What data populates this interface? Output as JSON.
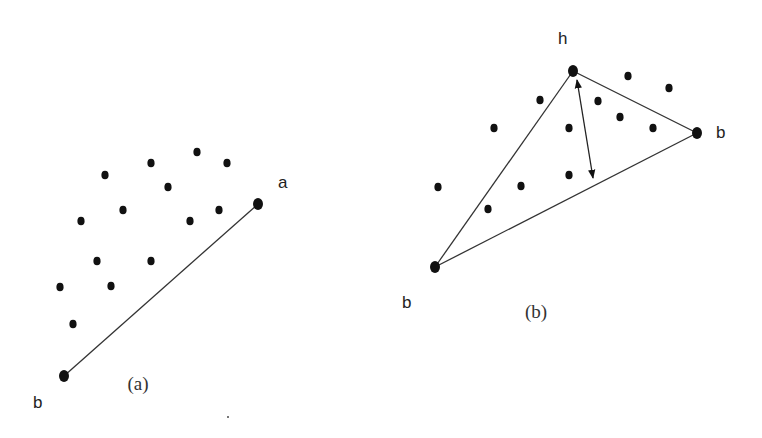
{
  "figure": {
    "panel_a": {
      "caption": "(a)",
      "caption_pos": [
        138,
        390
      ],
      "labels": [
        {
          "text": "a",
          "x": 278,
          "y": 188
        },
        {
          "text": "b",
          "x": 33,
          "y": 408
        }
      ],
      "endpoints": [
        {
          "name": "a",
          "x": 258,
          "y": 204
        },
        {
          "name": "b",
          "x": 64,
          "y": 376
        }
      ],
      "segments": [
        {
          "from": [
            64,
            376
          ],
          "to": [
            258,
            204
          ]
        }
      ],
      "points": [
        [
          105,
          175
        ],
        [
          151,
          163
        ],
        [
          197,
          152
        ],
        [
          227,
          163
        ],
        [
          168,
          187
        ],
        [
          123,
          210
        ],
        [
          81,
          221
        ],
        [
          190,
          221
        ],
        [
          219,
          210
        ],
        [
          97,
          261
        ],
        [
          151,
          261
        ],
        [
          60,
          287
        ],
        [
          111,
          286
        ],
        [
          73,
          324
        ]
      ]
    },
    "panel_b": {
      "caption": "(b)",
      "caption_pos": [
        536,
        318
      ],
      "labels": [
        {
          "text": "h",
          "x": 558,
          "y": 44
        },
        {
          "text": "b",
          "x": 716,
          "y": 138
        },
        {
          "text": "b",
          "x": 402,
          "y": 308
        }
      ],
      "endpoints": [
        {
          "name": "h",
          "x": 573,
          "y": 71
        },
        {
          "name": "b",
          "x": 697,
          "y": 133
        },
        {
          "name": "b",
          "x": 435,
          "y": 267
        }
      ],
      "segments": [
        {
          "from": [
            435,
            267
          ],
          "to": [
            573,
            71
          ]
        },
        {
          "from": [
            573,
            71
          ],
          "to": [
            697,
            133
          ]
        },
        {
          "from": [
            435,
            267
          ],
          "to": [
            697,
            133
          ]
        }
      ],
      "arrow": {
        "from": [
          577,
          80
        ],
        "to": [
          593,
          178
        ],
        "double_headed": true
      },
      "points": [
        [
          540,
          100
        ],
        [
          628,
          76
        ],
        [
          669,
          88
        ],
        [
          598,
          101
        ],
        [
          494,
          128
        ],
        [
          569,
          128
        ],
        [
          620,
          117
        ],
        [
          653,
          128
        ],
        [
          438,
          187
        ],
        [
          521,
          186
        ],
        [
          569,
          175
        ],
        [
          488,
          209
        ]
      ]
    },
    "stray_mark": [
      228,
      417
    ]
  }
}
